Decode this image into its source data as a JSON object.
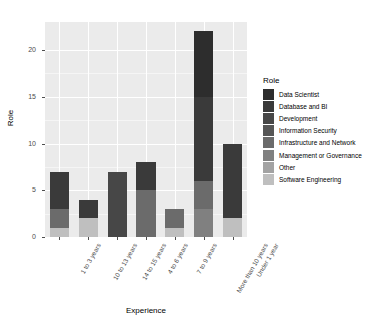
{
  "chart_data": {
    "type": "bar",
    "stacked": true,
    "title": "",
    "xlabel": "Experience",
    "ylabel": "Role",
    "ylim": [
      0,
      23
    ],
    "yticks": [
      0,
      5,
      10,
      15,
      20
    ],
    "ytick_labels": [
      "0",
      "5",
      "10",
      "15",
      "20"
    ],
    "grid": true,
    "legend_position": "right",
    "legend_title": "Role",
    "categories": [
      "1 to 3 years",
      "10 to 13 years",
      "14 to 15 years",
      "4 to 6 years",
      "7 to 9 years",
      "More than 10 years",
      "Under 1 year"
    ],
    "series": [
      {
        "name": "Data Scientist",
        "color": "#2d2d2d",
        "values": [
          0,
          0,
          0,
          0,
          0,
          7,
          0
        ]
      },
      {
        "name": "Database and BI",
        "color": "#3a3a3a",
        "values": [
          4,
          2,
          0,
          3,
          0,
          9,
          8
        ]
      },
      {
        "name": "Development",
        "color": "#474747",
        "values": [
          0,
          0,
          7,
          0,
          0,
          0,
          0
        ]
      },
      {
        "name": "Information Security",
        "color": "#565656",
        "values": [
          0,
          0,
          0,
          0,
          0,
          0,
          0
        ]
      },
      {
        "name": "Infrastructure and Network",
        "color": "#6b6b6b",
        "values": [
          2,
          0,
          0,
          5,
          2,
          3,
          0
        ]
      },
      {
        "name": "Management or Governance",
        "color": "#808080",
        "values": [
          0,
          0,
          0,
          0,
          0,
          3,
          0
        ]
      },
      {
        "name": "Other",
        "color": "#a3a3a3",
        "values": [
          0,
          0,
          0,
          0,
          0,
          0,
          0
        ]
      },
      {
        "name": "Software Engineering",
        "color": "#bfbfbf",
        "values": [
          1,
          2,
          0,
          0,
          1,
          0,
          2
        ]
      }
    ],
    "totals": [
      7,
      4,
      7,
      8,
      3,
      22,
      10
    ]
  },
  "legend": {
    "title": "Role",
    "items": [
      {
        "label": "Data Scientist",
        "color": "#2d2d2d"
      },
      {
        "label": "Database and BI",
        "color": "#3a3a3a"
      },
      {
        "label": "Development",
        "color": "#474747"
      },
      {
        "label": "Information Security",
        "color": "#565656"
      },
      {
        "label": "Infrastructure and Network",
        "color": "#6b6b6b"
      },
      {
        "label": "Management or Governance",
        "color": "#808080"
      },
      {
        "label": "Other",
        "color": "#a3a3a3"
      },
      {
        "label": "Software Engineering",
        "color": "#bfbfbf"
      }
    ]
  },
  "axes": {
    "x_title": "Experience",
    "y_title": "Role"
  },
  "theme": {
    "panel_background": "#ebebeb",
    "grid_major": "#ffffff",
    "grid_minor": "#f5f5f5",
    "text": "#4d4d4d",
    "page_background": "#ffffff"
  }
}
